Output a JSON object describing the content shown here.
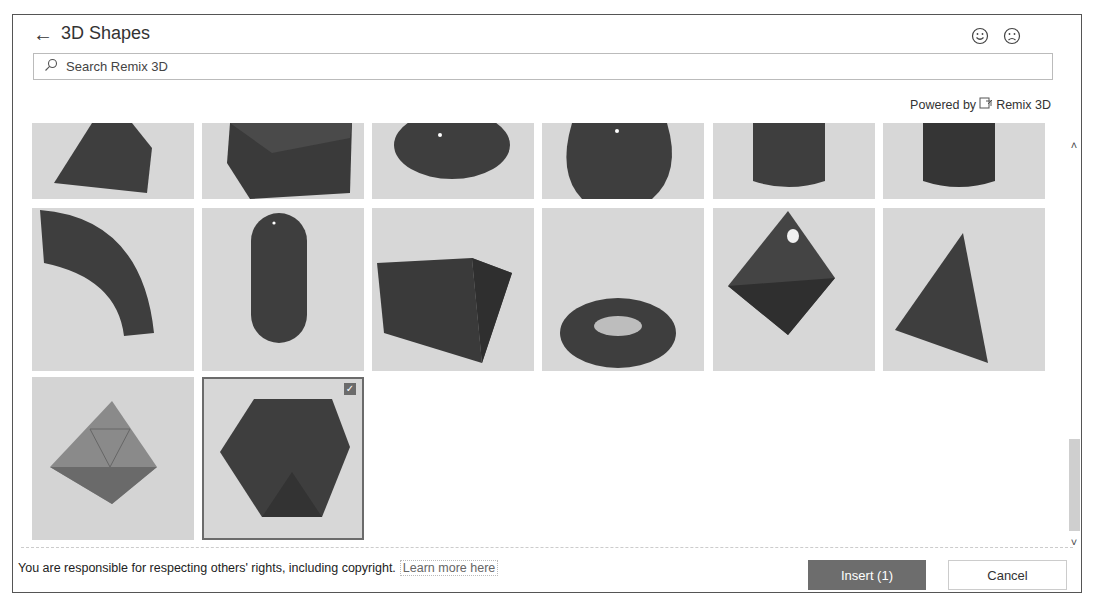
{
  "header": {
    "back_icon": "arrow-left-icon",
    "title": "3D Shapes",
    "feedback": {
      "happy_icon": "smiley-icon",
      "sad_icon": "frown-icon"
    }
  },
  "search": {
    "placeholder": "Search Remix 3D",
    "value": "",
    "icon": "search-icon"
  },
  "powered_by": {
    "prefix": "Powered by",
    "brand": "Remix 3D",
    "icon": "remix3d-logo-icon"
  },
  "grid": {
    "rows": [
      [
        {
          "shape": "square-pyramid",
          "selected": false
        },
        {
          "shape": "cube",
          "selected": false
        },
        {
          "shape": "ellipsoid",
          "selected": false
        },
        {
          "shape": "hemisphere",
          "selected": false
        },
        {
          "shape": "cylinder",
          "selected": false
        },
        {
          "shape": "cylinder-tall",
          "selected": false
        }
      ],
      [
        {
          "shape": "curved-pipe",
          "selected": false
        },
        {
          "shape": "capsule",
          "selected": false
        },
        {
          "shape": "triangular-prism",
          "selected": false
        },
        {
          "shape": "torus",
          "selected": false
        },
        {
          "shape": "octahedron",
          "selected": false
        },
        {
          "shape": "tetrahedron",
          "selected": false
        }
      ],
      [
        {
          "shape": "octahedron-faceted",
          "selected": false
        },
        {
          "shape": "dodecahedron",
          "selected": true
        }
      ]
    ]
  },
  "scrollbar": {
    "up_icon": "chevron-up-icon",
    "down_icon": "chevron-down-icon"
  },
  "footer": {
    "notice": "You are responsible for respecting others' rights, including copyright.",
    "learn_more": "Learn more here",
    "insert_label": "Insert (1)",
    "cancel_label": "Cancel"
  },
  "colors": {
    "primary_button": "#6d6d6d",
    "tile_bg": "#d7d7d7",
    "shape": "#3e3e3e"
  }
}
